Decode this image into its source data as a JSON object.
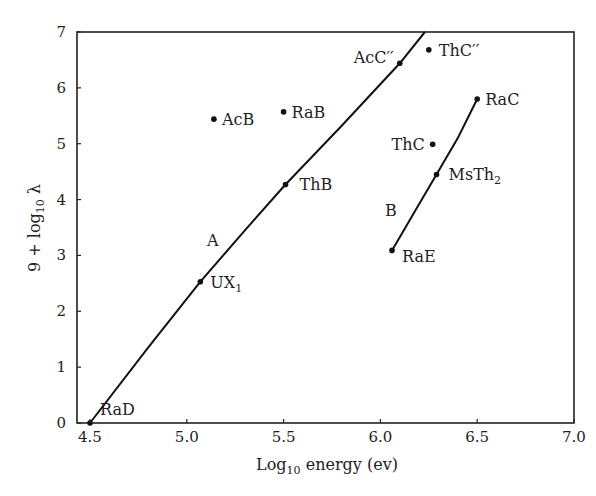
{
  "chart_data": {
    "type": "scatter",
    "title": "",
    "xlabel": "Log10 energy (ev)",
    "ylabel": "9 + log10 λ",
    "xlim": [
      4.5,
      7.0
    ],
    "ylim": [
      0,
      7
    ],
    "grid": false,
    "x_ticks": [
      "4.5",
      "5.0",
      "5.5",
      "6.0",
      "6.5",
      "7.0"
    ],
    "y_ticks": [
      "0",
      "1",
      "2",
      "3",
      "4",
      "5",
      "6",
      "7"
    ],
    "points": [
      {
        "label": "RaD",
        "x": 4.5,
        "y": 0.0
      },
      {
        "label": "UX1",
        "x": 5.07,
        "y": 2.53
      },
      {
        "label": "ThB",
        "x": 5.51,
        "y": 4.27
      },
      {
        "label": "AcB",
        "x": 5.14,
        "y": 5.44
      },
      {
        "label": "RaB",
        "x": 5.5,
        "y": 5.57
      },
      {
        "label": "AcC''",
        "x": 6.1,
        "y": 6.44
      },
      {
        "label": "ThC''",
        "x": 6.25,
        "y": 6.68
      },
      {
        "label": "RaC",
        "x": 6.5,
        "y": 5.8
      },
      {
        "label": "ThC",
        "x": 6.27,
        "y": 4.99
      },
      {
        "label": "MsTh2",
        "x": 6.29,
        "y": 4.45
      },
      {
        "label": "RaE",
        "x": 6.06,
        "y": 3.09
      }
    ],
    "series": [
      {
        "name": "A",
        "x": [
          4.5,
          4.8,
          5.07,
          5.3,
          5.51,
          5.8,
          6.1,
          6.23
        ],
        "y": [
          0.0,
          1.35,
          2.53,
          3.45,
          4.27,
          5.32,
          6.44,
          7.0
        ]
      },
      {
        "name": "B",
        "x": [
          6.06,
          6.18,
          6.29,
          6.4,
          6.5
        ],
        "y": [
          3.09,
          3.8,
          4.45,
          5.1,
          5.8
        ]
      }
    ],
    "annotations": [
      "A",
      "B"
    ]
  },
  "labels": {
    "xlabel_main": "Log",
    "xlabel_sub": "10",
    "xlabel_rest": " energy (ev)",
    "ylabel_pre": "9 + log",
    "ylabel_sub": "10",
    "ylabel_post": " λ",
    "curve_a": "A",
    "curve_b": "B"
  }
}
